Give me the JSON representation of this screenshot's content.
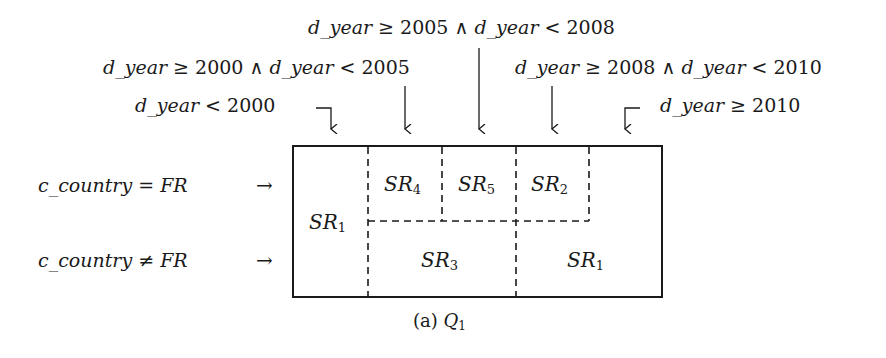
{
  "column_conditions": [
    {
      "id": "c1",
      "var": "d_year",
      "text": "< 2000"
    },
    {
      "id": "c2",
      "var": "d_year",
      "text": "≥ 2000 ∧ ",
      "var2": "d_year",
      "text2": "< 2005"
    },
    {
      "id": "c3",
      "var": "d_year",
      "text": "≥ 2005 ∧ ",
      "var2": "d_year",
      "text2": "< 2008"
    },
    {
      "id": "c4",
      "var": "d_year",
      "text": "≥ 2008 ∧ ",
      "var2": "d_year",
      "text2": "< 2010"
    },
    {
      "id": "c5",
      "var": "d_year",
      "text": "≥ 2010"
    }
  ],
  "row_conditions": [
    {
      "id": "r1",
      "var": "c_country",
      "op": " = ",
      "val": "FR",
      "arrow": "→"
    },
    {
      "id": "r2",
      "var": "c_country",
      "op": " ≠ ",
      "val": "FR",
      "arrow": "→"
    }
  ],
  "regions": [
    {
      "base": "SR",
      "sub": "4"
    },
    {
      "base": "SR",
      "sub": "5"
    },
    {
      "base": "SR",
      "sub": "2"
    },
    {
      "base": "SR",
      "sub": "1"
    },
    {
      "base": "SR",
      "sub": "3"
    },
    {
      "base": "SR",
      "sub": "1"
    }
  ],
  "caption": {
    "prefix": "(a) ",
    "q": "Q",
    "sub": "1"
  },
  "colors": {
    "stroke": "#1a1a1a",
    "background": "#ffffff"
  }
}
